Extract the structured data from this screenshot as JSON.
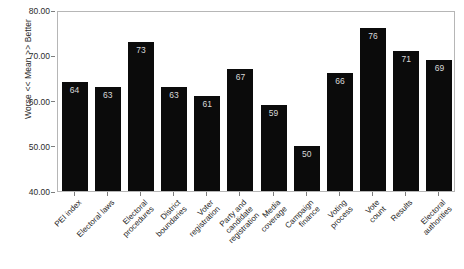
{
  "chart_data": {
    "type": "bar",
    "title": "",
    "xlabel": "",
    "ylabel": "Worse << Mean >> Better",
    "ylim": [
      40.0,
      80.0
    ],
    "yticks": [
      "40.00",
      "50.00",
      "60.00",
      "70.00",
      "80.00"
    ],
    "ytick_values": [
      40,
      50,
      60,
      70,
      80
    ],
    "grid": false,
    "legend": "none",
    "bar_color": "#0b0b0b",
    "value_label_color": "#d8d8d8",
    "categories": [
      "PEI index",
      "Electoral laws",
      "Electoral procedures",
      "District boundaries",
      "Voter registration",
      "Party and candidate registration",
      "Media coverage",
      "Campaign finance",
      "Voting process",
      "Vote count",
      "Results",
      "Electoral authorities"
    ],
    "category_lines": [
      [
        "PEI index"
      ],
      [
        "Electoral laws"
      ],
      [
        "Electoral",
        "procedures"
      ],
      [
        "District",
        "boundaries"
      ],
      [
        "Voter",
        "registration"
      ],
      [
        "Party and",
        "candidate",
        "registration"
      ],
      [
        "Media",
        "coverage"
      ],
      [
        "Campaign",
        "finance"
      ],
      [
        "Voting",
        "process"
      ],
      [
        "Vote",
        "count"
      ],
      [
        "Results"
      ],
      [
        "Electoral",
        "authorities"
      ]
    ],
    "values": [
      64,
      63,
      73,
      63,
      61,
      67,
      59,
      50,
      66,
      76,
      71,
      69
    ],
    "value_labels": [
      "64",
      "63",
      "73",
      "63",
      "61",
      "67",
      "59",
      "50",
      "66",
      "76",
      "71",
      "69"
    ]
  }
}
